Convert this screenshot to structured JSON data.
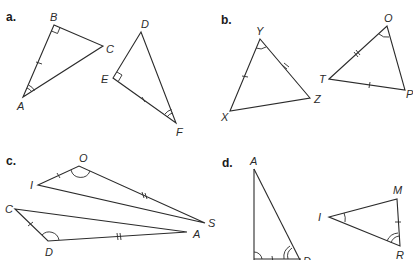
{
  "parts": [
    {
      "label": "a.",
      "triangles": [
        {
          "vertices": [
            "A",
            "B",
            "C"
          ],
          "right_angle": "B",
          "angle_mark": "A",
          "tick_side": "AB"
        },
        {
          "vertices": [
            "D",
            "E",
            "F"
          ],
          "right_angle": "E",
          "angle_mark": "F",
          "tick_side": "EF"
        }
      ]
    },
    {
      "label": "b.",
      "triangles": [
        {
          "vertices": [
            "X",
            "Y",
            "Z"
          ],
          "angle_mark": "Y",
          "single_tick_side": "XY",
          "double_tick_side": "YZ"
        },
        {
          "vertices": [
            "T",
            "O",
            "P"
          ],
          "angle_mark": "O",
          "single_tick_side": "TP",
          "double_tick_side": "TO"
        }
      ]
    },
    {
      "label": "c.",
      "triangles": [
        {
          "vertices": [
            "I",
            "O",
            "S"
          ],
          "angle_mark": "O",
          "single_tick_side": "IO",
          "double_tick_side": "OS"
        },
        {
          "vertices": [
            "C",
            "D",
            "A"
          ],
          "angle_mark": "D",
          "single_tick_side": "CD",
          "double_tick_side": "DA"
        }
      ]
    },
    {
      "label": "d.",
      "triangles": [
        {
          "vertices": [
            "A",
            "",
            "D"
          ],
          "angle_mark": "bottom-left",
          "double_angle_mark": "D",
          "tick_side": "bottom"
        },
        {
          "vertices": [
            "I",
            "M",
            "R"
          ],
          "angle_mark": "I",
          "double_angle_mark": "R",
          "tick_side": "MR"
        }
      ]
    }
  ],
  "labels": {
    "a": {
      "part": "a.",
      "A": "A",
      "B": "B",
      "C": "C",
      "D": "D",
      "E": "E",
      "F": "F"
    },
    "b": {
      "part": "b.",
      "Y": "Y",
      "X": "X",
      "Z": "Z",
      "O": "O",
      "T": "T",
      "P": "P"
    },
    "c": {
      "part": "c.",
      "O": "O",
      "I": "I",
      "S": "S",
      "C": "C",
      "D": "D",
      "A": "A"
    },
    "d": {
      "part": "d.",
      "A": "A",
      "D": "D",
      "I": "I",
      "M": "M",
      "R": "R"
    }
  }
}
